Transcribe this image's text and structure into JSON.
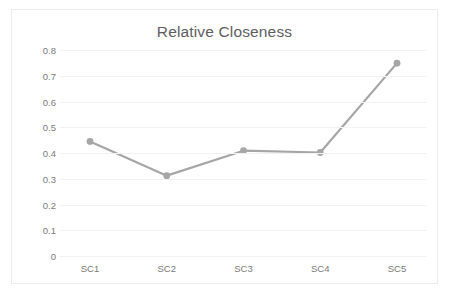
{
  "chart": {
    "title": "Relative Closeness",
    "frame_border_color": "#ececec",
    "background_color": "#ffffff",
    "gridline_color": "#f2f2f2",
    "tick_label_color": "#7a7a7a",
    "title_color": "#5e5e5e",
    "series_color": "#a6a6a6",
    "marker_color": "#a6a6a6"
  },
  "chart_data": {
    "type": "line",
    "title": "Relative Closeness",
    "xlabel": "",
    "ylabel": "",
    "categories": [
      "SC1",
      "SC2",
      "SC3",
      "SC4",
      "SC5"
    ],
    "values": [
      0.445,
      0.312,
      0.409,
      0.402,
      0.749
    ],
    "series": [
      {
        "name": "Relative Closeness",
        "values": [
          0.445,
          0.312,
          0.409,
          0.402,
          0.749
        ],
        "color": "#a6a6a6",
        "marker": "circle"
      }
    ],
    "ylim": [
      0,
      0.8
    ],
    "ytick_labels": [
      "0.8",
      "0.7",
      "0.6",
      "0.5",
      "0.4",
      "0.3",
      "0.2",
      "0.1",
      "0"
    ],
    "ytick_values": [
      0.8,
      0.7,
      0.6,
      0.5,
      0.4,
      0.3,
      0.2,
      0.1,
      0
    ],
    "grid": true,
    "grid_axis": "y",
    "legend": false,
    "legend_position": "none"
  }
}
